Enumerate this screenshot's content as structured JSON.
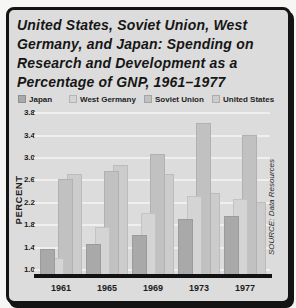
{
  "figure": {
    "title_lines": [
      "United States, Soviet Union, West",
      "Germany, and Japan: Spending on",
      "Research and Development as a",
      "Percentage of GNP, 1961–1977"
    ],
    "source": "SOURCE: Data Resources",
    "panel_bg": "#dcdcdc",
    "border_color": "#141414"
  },
  "chart_data": {
    "type": "bar",
    "categories": [
      "1961",
      "1965",
      "1969",
      "1973",
      "1977"
    ],
    "series": [
      {
        "name": "Japan",
        "color": "#a9a9a9",
        "values": [
          1.35,
          1.45,
          1.6,
          1.9,
          1.95
        ]
      },
      {
        "name": "West Germany",
        "color": "#d4d4d4",
        "values": [
          1.2,
          1.75,
          2.0,
          2.3,
          2.25
        ]
      },
      {
        "name": "Soviet Union",
        "color": "#c1c1c1",
        "values": [
          2.6,
          2.75,
          3.05,
          3.6,
          3.4
        ]
      },
      {
        "name": "United States",
        "color": "#cccccc",
        "values": [
          2.7,
          2.85,
          2.7,
          2.35,
          2.2
        ]
      }
    ],
    "xlabel": "",
    "ylabel": "PERCENT",
    "ylim": [
      1.0,
      3.8
    ],
    "yticks": [
      1.0,
      1.4,
      1.8,
      2.2,
      2.6,
      3.0,
      3.4,
      3.8
    ],
    "grid": true,
    "legend_position": "top",
    "source": "SOURCE: Data Resources"
  }
}
